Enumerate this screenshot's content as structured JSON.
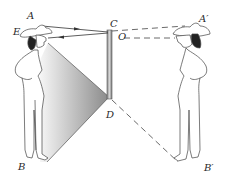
{
  "figure": {
    "colors": {
      "line": "#3a3a3a",
      "mirror_face": "#c8c8c8",
      "mirror_edge": "#6a6a6a",
      "shade_dark": "#8e8e8e",
      "shade_light": "#f4f4f4"
    },
    "labels": {
      "A": "A",
      "E": "E",
      "B": "B",
      "C": "C",
      "O": "O",
      "D": "D",
      "A_prime": "A′",
      "B_prime": "B′"
    },
    "objects": {
      "person": "woman with cowboy hat (object)",
      "mirror": "vertical plane mirror CD",
      "image": "mirror image of woman (A'B')",
      "light_cone": "shaded region from eye E to feet B via D"
    }
  }
}
